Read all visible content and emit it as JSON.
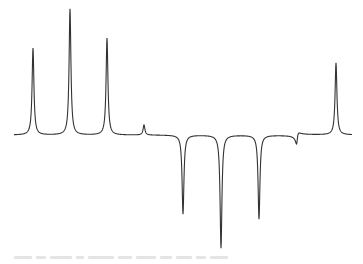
{
  "chart_data": {
    "type": "line",
    "title": "",
    "xlabel": "",
    "ylabel": "",
    "grid": false,
    "legend": null,
    "baseline_y_px": 135,
    "x_range_px": [
      14,
      352
    ],
    "peaks": [
      {
        "x": 33,
        "height": 87,
        "sign": "positive"
      },
      {
        "x": 70,
        "height": 126,
        "sign": "positive"
      },
      {
        "x": 107,
        "height": 97,
        "sign": "positive"
      },
      {
        "x": 144,
        "height": 10,
        "sign": "positive"
      },
      {
        "x": 183,
        "height": -79,
        "sign": "negative"
      },
      {
        "x": 221,
        "height": -113,
        "sign": "negative"
      },
      {
        "x": 259,
        "height": -84,
        "sign": "negative"
      },
      {
        "x": 297,
        "height": -7,
        "sign": "dispersive"
      },
      {
        "x": 336,
        "height": 72,
        "sign": "positive"
      }
    ]
  },
  "caption": {
    "legible": false,
    "segments": [
      18,
      10,
      22,
      8,
      26,
      14,
      20,
      12,
      16,
      10,
      18
    ]
  },
  "colors": {
    "trace": "#333333",
    "caption": "#e4e4e4"
  }
}
